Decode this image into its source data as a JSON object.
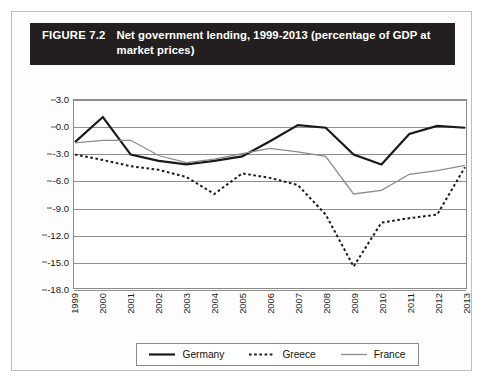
{
  "figure": {
    "number": "FIGURE 7.2",
    "title": "Net government lending, 1999-2013 (percentage of GDP at market prices)",
    "header_bg": "#231f20",
    "header_fg": "#ffffff"
  },
  "chart_data": {
    "type": "line",
    "title": "Net government lending, 1999-2013 (percentage of GDP at market prices)",
    "xlabel": "",
    "ylabel": "",
    "grid": true,
    "legend_position": "bottom",
    "ylim": [
      -18.0,
      3.0
    ],
    "ytick_labels": [
      "3.0",
      "0.0",
      "-3.0",
      "-6.0",
      "-9.0",
      "-12.0",
      "-15.0",
      "-18.0"
    ],
    "ytick_values": [
      3.0,
      0.0,
      -3.0,
      -6.0,
      -9.0,
      -12.0,
      -15.0,
      -18.0
    ],
    "categories": [
      "1999",
      "2000",
      "2001",
      "2002",
      "2003",
      "2004",
      "2005",
      "2006",
      "2007",
      "2008",
      "2009",
      "2010",
      "2011",
      "2012",
      "2013"
    ],
    "series": [
      {
        "name": "Germany",
        "color": "#1a1a1a",
        "style": "solid",
        "width": 2.2,
        "values": [
          -1.7,
          1.1,
          -3.1,
          -3.8,
          -4.2,
          -3.8,
          -3.3,
          -1.6,
          0.2,
          -0.1,
          -3.1,
          -4.2,
          -0.8,
          0.1,
          -0.1
        ]
      },
      {
        "name": "Greece",
        "color": "#1a1a1a",
        "style": "dotted",
        "width": 2.0,
        "values": [
          -3.1,
          -3.7,
          -4.4,
          -4.8,
          -5.6,
          -7.5,
          -5.2,
          -5.7,
          -6.5,
          -9.8,
          -15.6,
          -10.7,
          -10.2,
          -9.8,
          -4.5
        ]
      },
      {
        "name": "France",
        "color": "#8c8c8c",
        "style": "solid",
        "width": 1.3,
        "values": [
          -1.8,
          -1.5,
          -1.5,
          -3.2,
          -4.0,
          -3.6,
          -3.0,
          -2.4,
          -2.8,
          -3.3,
          -7.5,
          -7.1,
          -5.3,
          -4.9,
          -4.3
        ]
      }
    ]
  },
  "legend": {
    "items": [
      {
        "label": "Germany",
        "swatch": "line-solid-black-icon"
      },
      {
        "label": "Greece",
        "swatch": "line-dotted-black-icon"
      },
      {
        "label": "France",
        "swatch": "line-solid-gray-icon"
      }
    ]
  }
}
